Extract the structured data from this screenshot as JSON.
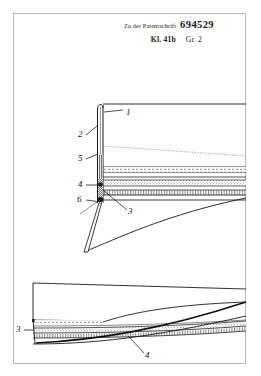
{
  "document": {
    "type": "patent-drawing-sheet",
    "header": {
      "prefix_text": "Zu der Patentschrift",
      "patent_number": "694529",
      "class_label": "Kl. 41b",
      "group_label": "Gr. 2"
    },
    "figures": [
      {
        "id": "figure-upper",
        "description": "Longitudinal sectional view with vertical hatched end member and horizontal layered bands",
        "reference_numerals": [
          {
            "label": "1",
            "x": 126,
            "y": 113
          },
          {
            "label": "2",
            "x": 78,
            "y": 136
          },
          {
            "label": "5",
            "x": 78,
            "y": 159
          },
          {
            "label": "4",
            "x": 78,
            "y": 184
          },
          {
            "label": "6",
            "x": 78,
            "y": 199
          },
          {
            "label": "3",
            "x": 129,
            "y": 211
          }
        ]
      },
      {
        "id": "figure-lower",
        "description": "Plan sectional view of the layered strip with tapered tip",
        "reference_numerals": [
          {
            "label": "3",
            "x": 17,
            "y": 330
          },
          {
            "label": "4",
            "x": 146,
            "y": 356
          }
        ]
      }
    ],
    "colors": {
      "ink": "#141414",
      "border": "#b9b9bb",
      "paper": "#fefefe",
      "hatch": "#3a3a3a"
    }
  }
}
